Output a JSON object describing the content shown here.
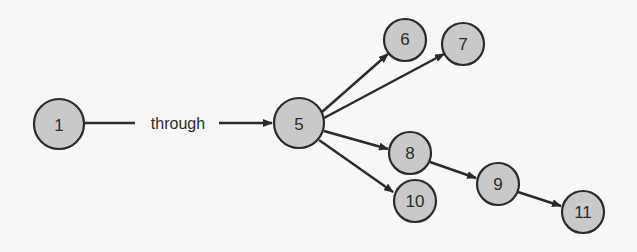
{
  "diagram": {
    "nodes": [
      {
        "id": "1",
        "label": "1",
        "x": 59,
        "y": 124,
        "r": 25
      },
      {
        "id": "5",
        "label": "5",
        "x": 299,
        "y": 123,
        "r": 25
      },
      {
        "id": "6",
        "label": "6",
        "x": 405,
        "y": 40,
        "r": 21
      },
      {
        "id": "7",
        "label": "7",
        "x": 463,
        "y": 44,
        "r": 21
      },
      {
        "id": "8",
        "label": "8",
        "x": 410,
        "y": 153,
        "r": 21
      },
      {
        "id": "10",
        "label": "10",
        "x": 415,
        "y": 201,
        "r": 21
      },
      {
        "id": "9",
        "label": "9",
        "x": 498,
        "y": 184,
        "r": 21
      },
      {
        "id": "11",
        "label": "11",
        "x": 583,
        "y": 212,
        "r": 21
      }
    ],
    "edges": [
      {
        "from": "1",
        "to": "5",
        "label": "through"
      },
      {
        "from": "5",
        "to": "6"
      },
      {
        "from": "5",
        "to": "7"
      },
      {
        "from": "5",
        "to": "8"
      },
      {
        "from": "5",
        "to": "10"
      },
      {
        "from": "8",
        "to": "9"
      },
      {
        "from": "9",
        "to": "11"
      }
    ],
    "through_label": "through",
    "colors": {
      "node_fill": "#c9c9c7",
      "stroke": "#2a2a2a",
      "background": "#f7f7f5"
    }
  }
}
